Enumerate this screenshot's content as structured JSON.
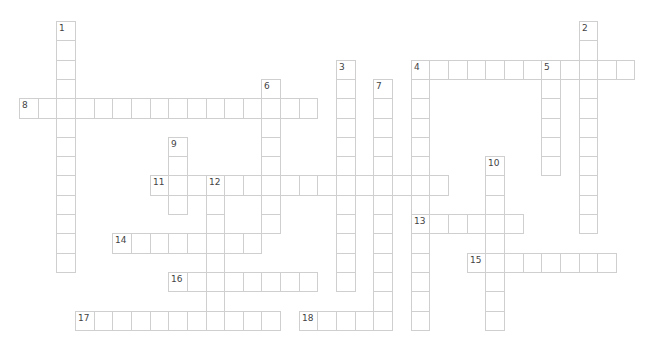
{
  "puzzle": {
    "grid": {
      "origin_x": 19,
      "origin_y": 21,
      "cell_w": 18.65,
      "cell_h": 19.3
    },
    "entries": [
      {
        "number": "1",
        "direction": "down",
        "col": 2,
        "row": 0,
        "length": 13
      },
      {
        "number": "2",
        "direction": "down",
        "col": 30,
        "row": 0,
        "length": 11
      },
      {
        "number": "3",
        "direction": "down",
        "col": 17,
        "row": 2,
        "length": 12
      },
      {
        "number": "4",
        "direction": "across",
        "col": 21,
        "row": 2,
        "length": 12
      },
      {
        "number": "4",
        "direction": "down",
        "col": 21,
        "row": 2,
        "length": 14
      },
      {
        "number": "5",
        "direction": "down",
        "col": 28,
        "row": 2,
        "length": 6
      },
      {
        "number": "6",
        "direction": "down",
        "col": 13,
        "row": 3,
        "length": 8
      },
      {
        "number": "7",
        "direction": "down",
        "col": 19,
        "row": 3,
        "length": 13
      },
      {
        "number": "8",
        "direction": "across",
        "col": 0,
        "row": 4,
        "length": 16
      },
      {
        "number": "9",
        "direction": "down",
        "col": 8,
        "row": 6,
        "length": 4
      },
      {
        "number": "10",
        "direction": "down",
        "col": 25,
        "row": 7,
        "length": 9
      },
      {
        "number": "11",
        "direction": "across",
        "col": 7,
        "row": 8,
        "length": 16
      },
      {
        "number": "12",
        "direction": "down",
        "col": 10,
        "row": 8,
        "length": 8
      },
      {
        "number": "13",
        "direction": "across",
        "col": 21,
        "row": 10,
        "length": 6
      },
      {
        "number": "14",
        "direction": "across",
        "col": 5,
        "row": 11,
        "length": 8
      },
      {
        "number": "15",
        "direction": "across",
        "col": 24,
        "row": 12,
        "length": 8
      },
      {
        "number": "16",
        "direction": "across",
        "col": 8,
        "row": 13,
        "length": 8
      },
      {
        "number": "17",
        "direction": "across",
        "col": 3,
        "row": 15,
        "length": 11
      },
      {
        "number": "18",
        "direction": "across",
        "col": 15,
        "row": 15,
        "length": 5
      }
    ]
  }
}
